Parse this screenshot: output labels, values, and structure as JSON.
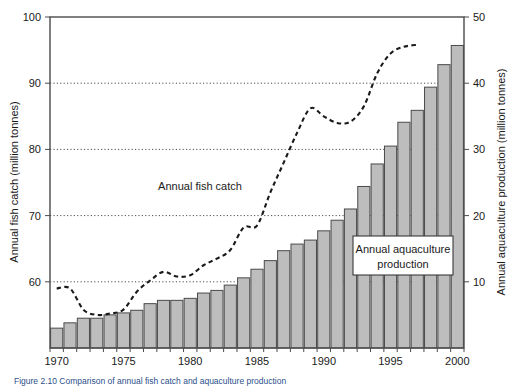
{
  "figure": {
    "caption": "Figure 2.10   Comparison of annual fish catch and aquaculture production",
    "background_color": "#ffffff"
  },
  "colors": {
    "bar_fill": "#bdbdbd",
    "bar_stroke": "#4a4a4a",
    "line": "#1a1a1a",
    "grid": "#3a3a3a",
    "frame": "#4a4a4a",
    "caption": "#2b4f8a"
  },
  "annotations": [
    {
      "name": "fish-catch-label",
      "text": "Annual fish catch",
      "x": 200,
      "y": 186
    },
    {
      "name": "aquaculture-label-line1",
      "text": "Annual aquaculture",
      "x": 403,
      "y": 251
    },
    {
      "name": "aquaculture-label-line2",
      "text": "production",
      "x": 403,
      "y": 266
    }
  ],
  "chart_data": {
    "type": "bar",
    "title": "",
    "subtitle": "",
    "xlabel": "",
    "ylabel": "Annual fish catch (million tonnes)",
    "y2label": "Annual aquaculture production (million tonnes)",
    "ylim": [
      50,
      100
    ],
    "y2lim": [
      0,
      50
    ],
    "xlim": [
      1970,
      2000
    ],
    "ytick_labels": [
      "100",
      "90",
      "80",
      "70",
      "60"
    ],
    "yticks": [
      100,
      90,
      80,
      70,
      60
    ],
    "y2tick_labels": [
      "50",
      "40",
      "30",
      "20",
      "10"
    ],
    "y2ticks": [
      50,
      40,
      30,
      20,
      10
    ],
    "xtick_labels": [
      "1970",
      "1975",
      "1980",
      "1985",
      "1990",
      "1995",
      "2000"
    ],
    "xticks": [
      1970,
      1975,
      1980,
      1985,
      1990,
      1995,
      2000
    ],
    "grid": "horizontal-dotted",
    "legend": "inline-annotations",
    "x": [
      1970,
      1971,
      1972,
      1973,
      1974,
      1975,
      1976,
      1977,
      1978,
      1979,
      1980,
      1981,
      1982,
      1983,
      1984,
      1985,
      1986,
      1987,
      1988,
      1989,
      1990,
      1991,
      1992,
      1993,
      1994,
      1995,
      1996,
      1997,
      1998,
      1999,
      2000
    ],
    "series": [
      {
        "name": "Annual aquaculture production",
        "units": "million tonnes",
        "axis": "right",
        "render": "bar",
        "values": [
          3.0,
          3.8,
          4.5,
          4.5,
          5.0,
          5.3,
          5.7,
          6.7,
          7.2,
          7.2,
          7.5,
          8.3,
          8.7,
          9.5,
          10.6,
          11.9,
          13.2,
          14.7,
          15.7,
          16.3,
          17.7,
          19.3,
          21.0,
          24.4,
          27.8,
          30.5,
          34.1,
          35.9,
          39.4,
          42.8,
          45.7
        ]
      },
      {
        "name": "Annual fish catch",
        "units": "million tonnes",
        "axis": "left",
        "render": "dashed-line",
        "values": [
          59.0,
          59.0,
          55.8,
          55.0,
          55.2,
          55.8,
          58.5,
          60.2,
          61.5,
          60.8,
          61.0,
          62.5,
          63.5,
          64.8,
          68.2,
          68.5,
          73.5,
          78.0,
          82.5,
          86.2,
          85.0,
          84.0,
          84.2,
          86.5,
          91.5,
          94.5,
          95.5,
          95.8,
          null,
          null,
          null
        ]
      }
    ]
  }
}
